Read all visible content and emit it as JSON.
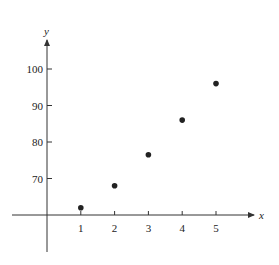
{
  "chart_data": {
    "type": "scatter",
    "title": "",
    "xlabel": "x",
    "ylabel": "y",
    "x": [
      1,
      2,
      3,
      4,
      5
    ],
    "y": [
      62,
      68,
      76.5,
      86,
      96
    ],
    "x_ticks": [
      1,
      2,
      3,
      4,
      5
    ],
    "y_ticks": [
      70,
      80,
      90,
      100
    ],
    "xlim": [
      -1,
      6.5
    ],
    "ylim": [
      60,
      109
    ],
    "x_axis_crosses_y_at": 60,
    "grid": false,
    "legend": null,
    "marker_color": "#222222",
    "axis_color": "#333333"
  }
}
